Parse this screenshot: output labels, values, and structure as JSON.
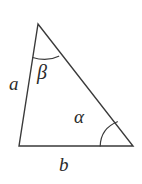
{
  "figure": {
    "type": "geometry-diagram",
    "shape": "triangle",
    "background_color": "#ffffff",
    "stroke_color": "#3a3a3a",
    "stroke_width": 1.4,
    "label_color": "#2b2b2b",
    "vertices": {
      "apex": {
        "name": "top-vertex",
        "x": 38,
        "y": 24
      },
      "bottom_left": {
        "name": "bottom-left-vertex",
        "x": 19,
        "y": 146
      },
      "bottom_right": {
        "name": "bottom-right-vertex",
        "x": 133,
        "y": 146
      }
    },
    "sides": [
      {
        "id": "a",
        "label": "a",
        "from": "apex",
        "to": "bottom_left",
        "label_x": 9,
        "label_y": 74
      },
      {
        "id": "b",
        "label": "b",
        "from": "bottom_left",
        "to": "bottom_right",
        "label_x": 59,
        "label_y": 155
      },
      {
        "id": "c",
        "label": "",
        "from": "apex",
        "to": "bottom_right",
        "label_x": 0,
        "label_y": 0
      }
    ],
    "angles": [
      {
        "id": "beta",
        "label": "β",
        "at_vertex": "apex",
        "arc_radius": 34,
        "label_x": 37,
        "label_y": 62
      },
      {
        "id": "alpha",
        "label": "α",
        "at_vertex": "bottom_right",
        "arc_radius": 33,
        "label_x": 74,
        "label_y": 107
      }
    ],
    "paths": {
      "triangle_outline": "M 38 24 L 19 146 L 133 146 Z",
      "beta_arc": "M 32.7 57.5 Q 47 62 58.7 56.2",
      "alpha_arc": "M 100.2 146 Q 100.8 128.5 117.4 121.8"
    }
  }
}
